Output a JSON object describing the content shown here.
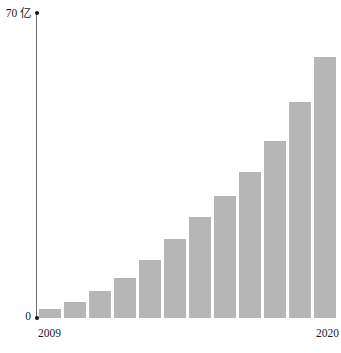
{
  "chart_data": {
    "type": "bar",
    "title": "",
    "subtitle": "",
    "xlabel": "",
    "ylabel": "亿",
    "unit": "亿",
    "categories": [
      "2009",
      "2010",
      "2011",
      "2012",
      "2013",
      "2014",
      "2015",
      "2016",
      "2017",
      "2018",
      "2019",
      "2020"
    ],
    "values": [
      2.0,
      3.7,
      6.2,
      9.2,
      13.3,
      18.1,
      23.2,
      28.0,
      33.5,
      40.6,
      49.6,
      59.9
    ],
    "ylim": [
      0,
      70
    ],
    "y_ticks": [
      0,
      70
    ],
    "y_tick_labels": [
      "0",
      "70 亿"
    ],
    "x_tick_labels": [
      "2009",
      "2020"
    ],
    "grid": false,
    "legend": null,
    "bar_color": "#b6b6b6",
    "axis_color": "#6e6e6e",
    "text_color": "#1b1b1b"
  },
  "axis": {
    "y_max_label": "70 亿",
    "y_zero_label": "0",
    "x_first_label": "2009",
    "x_last_label": "2020"
  }
}
